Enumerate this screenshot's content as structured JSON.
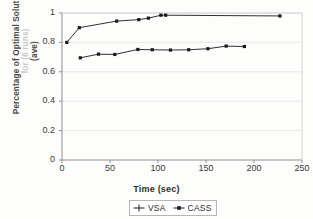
{
  "chart_data": {
    "type": "line",
    "title": "",
    "xlabel": "Time (sec)",
    "ylabel_line1": "Percentage of Optimal Solution",
    "ylabel_line2": "for (6 runs)",
    "ylabel_line3": "(ave)",
    "xlim": [
      0,
      250
    ],
    "ylim": [
      0,
      1
    ],
    "xticks": [
      "0",
      "50",
      "100",
      "150",
      "200",
      "250"
    ],
    "xtick_values": [
      0,
      50,
      100,
      150,
      200,
      250
    ],
    "yticks": [
      "0",
      "0.2",
      "0.4",
      "0.6",
      "0.8",
      "1"
    ],
    "ytick_values": [
      0,
      0.2,
      0.4,
      0.6,
      0.8,
      1
    ],
    "grid": "horizontal",
    "legend_position": "bottom",
    "series": [
      {
        "name": "VSA",
        "marker": "plus",
        "color": "#1a1a1a",
        "points": [
          {
            "x": 19,
            "y": 0.695
          },
          {
            "x": 38,
            "y": 0.72
          },
          {
            "x": 55,
            "y": 0.718
          },
          {
            "x": 79,
            "y": 0.752
          },
          {
            "x": 94,
            "y": 0.75
          },
          {
            "x": 113,
            "y": 0.748
          },
          {
            "x": 132,
            "y": 0.75
          },
          {
            "x": 152,
            "y": 0.757
          },
          {
            "x": 171,
            "y": 0.775
          },
          {
            "x": 190,
            "y": 0.772
          }
        ]
      },
      {
        "name": "CASS",
        "marker": "square",
        "color": "#1a1a1a",
        "points": [
          {
            "x": 5,
            "y": 0.8
          },
          {
            "x": 18,
            "y": 0.9
          },
          {
            "x": 57,
            "y": 0.945
          },
          {
            "x": 80,
            "y": 0.955
          },
          {
            "x": 90,
            "y": 0.965
          },
          {
            "x": 103,
            "y": 0.985
          },
          {
            "x": 108,
            "y": 0.985
          },
          {
            "x": 227,
            "y": 0.98
          }
        ]
      }
    ]
  },
  "legend": {
    "items": [
      {
        "label": "VSA",
        "marker": "plus"
      },
      {
        "label": "CASS",
        "marker": "square"
      }
    ]
  },
  "colors": {
    "axis": "#9a9a9a",
    "grid": "#e2e2e2",
    "series": "#1a1a1a",
    "tick_text": "#3a3a3a",
    "label_text": "#2d2d2d",
    "background": "#fdfdfc"
  }
}
